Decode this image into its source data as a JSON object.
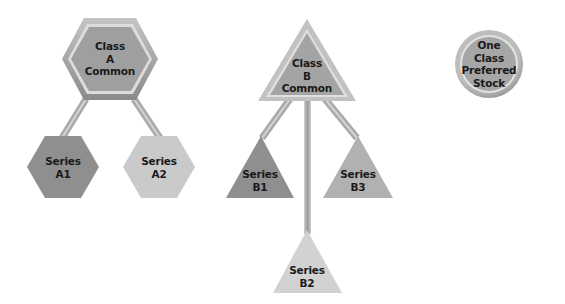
{
  "diagram": {
    "title": "",
    "colors": {
      "background": "#ffffff",
      "dark_fill": "#8e8e8e",
      "light_fill": "#c9c9c9",
      "connector": "#a8a8a8",
      "text": "#1a1a1a"
    },
    "nodes": {
      "class_a": {
        "shape": "hexagon",
        "lines": [
          "Class",
          "A",
          "Common"
        ]
      },
      "series_a1": {
        "shape": "hexagon",
        "lines": [
          "Series",
          "A1"
        ]
      },
      "series_a2": {
        "shape": "hexagon",
        "lines": [
          "Series",
          "A2"
        ]
      },
      "class_b": {
        "shape": "triangle",
        "lines": [
          "Class",
          "B",
          "Common"
        ]
      },
      "series_b1": {
        "shape": "triangle",
        "lines": [
          "Series",
          "B1"
        ]
      },
      "series_b2": {
        "shape": "triangle",
        "lines": [
          "Series",
          "B2"
        ]
      },
      "series_b3": {
        "shape": "triangle",
        "lines": [
          "Series",
          "B3"
        ]
      },
      "preferred": {
        "shape": "circle",
        "lines": [
          "One",
          "Class",
          "Preferred",
          "Stock"
        ]
      }
    },
    "edges": [
      [
        "class_a",
        "series_a1"
      ],
      [
        "class_a",
        "series_a2"
      ],
      [
        "class_b",
        "series_b1"
      ],
      [
        "class_b",
        "series_b2"
      ],
      [
        "class_b",
        "series_b3"
      ]
    ]
  }
}
